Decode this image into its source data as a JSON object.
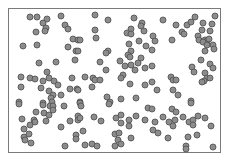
{
  "figure": {
    "frame": {
      "x": 8,
      "y": 8,
      "width": 213,
      "height": 145,
      "stroke": "#7a7a7a"
    },
    "dot_style": {
      "radius": 3,
      "fill": "#8c8c8c",
      "stroke": "#555555",
      "stroke_width": 0.9
    },
    "dots": [
      [
        30,
        17
      ],
      [
        37,
        17
      ],
      [
        47,
        19
      ],
      [
        43,
        23
      ],
      [
        46,
        28
      ],
      [
        45,
        31
      ],
      [
        61,
        16
      ],
      [
        65,
        25
      ],
      [
        68,
        29
      ],
      [
        36,
        32
      ],
      [
        23,
        46
      ],
      [
        37,
        45
      ],
      [
        73,
        39
      ],
      [
        78,
        40
      ],
      [
        68,
        47
      ],
      [
        76,
        51
      ],
      [
        95,
        15
      ],
      [
        108,
        20
      ],
      [
        95,
        30
      ],
      [
        96,
        38
      ],
      [
        80,
        40
      ],
      [
        134,
        18
      ],
      [
        142,
        23
      ],
      [
        141,
        26
      ],
      [
        131,
        29
      ],
      [
        127,
        33
      ],
      [
        131,
        34
      ],
      [
        144,
        31
      ],
      [
        139,
        41
      ],
      [
        129,
        44
      ],
      [
        146,
        46
      ],
      [
        108,
        51
      ],
      [
        106,
        53
      ],
      [
        131,
        51
      ],
      [
        128,
        55
      ],
      [
        78,
        51
      ],
      [
        163,
        20
      ],
      [
        176,
        25
      ],
      [
        187,
        25
      ],
      [
        191,
        22
      ],
      [
        195,
        17
      ],
      [
        182,
        32
      ],
      [
        184,
        34
      ],
      [
        172,
        40
      ],
      [
        153,
        36
      ],
      [
        155,
        41
      ],
      [
        152,
        50
      ],
      [
        203,
        23
      ],
      [
        202,
        30
      ],
      [
        198,
        36
      ],
      [
        210,
        31
      ],
      [
        212,
        24
      ],
      [
        215,
        16
      ],
      [
        199,
        40
      ],
      [
        205,
        40
      ],
      [
        207,
        41
      ],
      [
        209,
        39
      ],
      [
        203,
        42
      ],
      [
        213,
        45
      ],
      [
        214,
        49
      ],
      [
        207,
        45
      ],
      [
        205,
        51
      ],
      [
        39,
        63
      ],
      [
        56,
        62
      ],
      [
        75,
        60
      ],
      [
        47,
        72
      ],
      [
        21,
        77
      ],
      [
        30,
        78
      ],
      [
        35,
        79
      ],
      [
        43,
        81
      ],
      [
        49,
        78
      ],
      [
        54,
        81
      ],
      [
        58,
        85
      ],
      [
        21,
        87
      ],
      [
        41,
        88
      ],
      [
        49,
        91
      ],
      [
        53,
        95
      ],
      [
        51,
        98
      ],
      [
        61,
        95
      ],
      [
        70,
        89
      ],
      [
        72,
        78
      ],
      [
        77,
        89
      ],
      [
        19,
        102
      ],
      [
        43,
        103
      ],
      [
        52,
        102
      ],
      [
        80,
        102
      ],
      [
        100,
        62
      ],
      [
        120,
        61
      ],
      [
        130,
        57
      ],
      [
        138,
        63
      ],
      [
        141,
        58
      ],
      [
        125,
        66
      ],
      [
        131,
        65
      ],
      [
        135,
        70
      ],
      [
        145,
        68
      ],
      [
        106,
        70
      ],
      [
        85,
        77
      ],
      [
        93,
        78
      ],
      [
        95,
        80
      ],
      [
        100,
        80
      ],
      [
        123,
        75
      ],
      [
        121,
        78
      ],
      [
        130,
        84
      ],
      [
        145,
        85
      ],
      [
        92,
        87
      ],
      [
        78,
        90
      ],
      [
        107,
        97
      ],
      [
        110,
        102
      ],
      [
        121,
        99
      ],
      [
        136,
        98
      ],
      [
        80,
        103
      ],
      [
        152,
        66
      ],
      [
        201,
        60
      ],
      [
        210,
        64
      ],
      [
        213,
        68
      ],
      [
        192,
        67
      ],
      [
        194,
        72
      ],
      [
        205,
        73
      ],
      [
        207,
        78
      ],
      [
        210,
        78
      ],
      [
        204,
        81
      ],
      [
        202,
        82
      ],
      [
        171,
        77
      ],
      [
        173,
        80
      ],
      [
        176,
        80
      ],
      [
        152,
        82
      ],
      [
        157,
        90
      ],
      [
        173,
        90
      ],
      [
        178,
        95
      ],
      [
        191,
        101
      ],
      [
        19,
        104
      ],
      [
        43,
        105
      ],
      [
        50,
        106
      ],
      [
        53,
        106
      ],
      [
        64,
        106
      ],
      [
        53,
        110
      ],
      [
        36,
        112
      ],
      [
        44,
        113
      ],
      [
        49,
        115
      ],
      [
        22,
        119
      ],
      [
        34,
        120
      ],
      [
        35,
        122
      ],
      [
        30,
        125
      ],
      [
        46,
        121
      ],
      [
        70,
        121
      ],
      [
        61,
        127
      ],
      [
        78,
        116
      ],
      [
        78,
        120
      ],
      [
        24,
        129
      ],
      [
        29,
        134
      ],
      [
        24,
        137
      ],
      [
        25,
        140
      ],
      [
        31,
        143
      ],
      [
        76,
        135
      ],
      [
        76,
        139
      ],
      [
        65,
        146
      ],
      [
        81,
        106
      ],
      [
        109,
        104
      ],
      [
        148,
        108
      ],
      [
        80,
        118
      ],
      [
        94,
        117
      ],
      [
        101,
        121
      ],
      [
        116,
        118
      ],
      [
        121,
        115
      ],
      [
        121,
        123
      ],
      [
        129,
        120
      ],
      [
        129,
        126
      ],
      [
        136,
        116
      ],
      [
        145,
        120
      ],
      [
        83,
        131
      ],
      [
        115,
        134
      ],
      [
        119,
        133
      ],
      [
        118,
        140
      ],
      [
        131,
        138
      ],
      [
        121,
        144
      ],
      [
        115,
        146
      ],
      [
        85,
        145
      ],
      [
        92,
        144
      ],
      [
        97,
        146
      ],
      [
        152,
        109
      ],
      [
        172,
        109
      ],
      [
        176,
        112
      ],
      [
        191,
        103
      ],
      [
        163,
        117
      ],
      [
        155,
        122
      ],
      [
        169,
        122
      ],
      [
        173,
        126
      ],
      [
        175,
        120
      ],
      [
        183,
        117
      ],
      [
        189,
        122
      ],
      [
        193,
        120
      ],
      [
        193,
        125
      ],
      [
        198,
        116
      ],
      [
        205,
        118
      ],
      [
        211,
        126
      ],
      [
        153,
        130
      ],
      [
        158,
        133
      ],
      [
        168,
        138
      ],
      [
        188,
        137
      ],
      [
        197,
        135
      ],
      [
        186,
        146
      ],
      [
        186,
        149
      ],
      [
        213,
        147
      ]
    ]
  }
}
